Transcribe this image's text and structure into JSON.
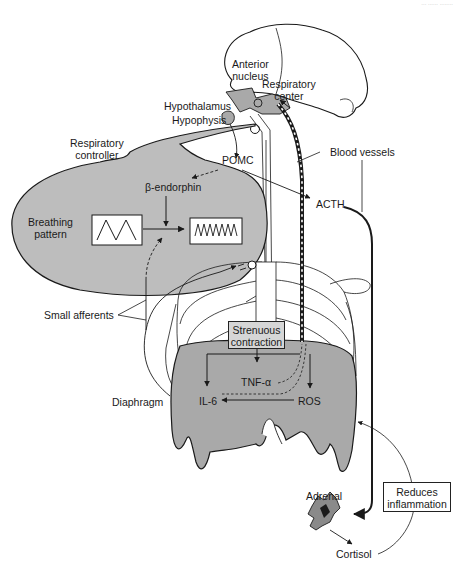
{
  "header": {
    "faint_text": "... ...... ........"
  },
  "colors": {
    "shaded_region": "#bcbcbc",
    "diaphragm": "#a9a9a9",
    "line": "#1a1a1a",
    "background": "#ffffff",
    "box_fill": "#d6d6d6"
  },
  "labels": {
    "anterior_nucleus": "Anterior\nnucleus",
    "respiratory_center": "Respiratory\ncenter",
    "hypothalamus": "Hypothalamus",
    "hypophysis": "Hypophysis",
    "respiratory_controller": "Respiratory\ncontroller",
    "pomc": "POMC",
    "beta_endorphin": "β-endorphin",
    "blood_vessels": "Blood vessels",
    "acth": "ACTH",
    "breathing_pattern": "Breathing\npattern",
    "small_afferents": "Small afferents",
    "strenuous_contraction": "Strenuous\ncontraction",
    "tnf_alpha": "TNF-α",
    "il6": "IL-6",
    "ros": "ROS",
    "diaphragm": "Diaphragm",
    "adrenal": "Adrenal",
    "reduces_inflammation": "Reduces\ninflammation",
    "cortisol": "Cortisol"
  },
  "flows": [
    {
      "from": "Hypophysis",
      "to": "POMC",
      "style": "solid"
    },
    {
      "from": "POMC",
      "to": "β-endorphin",
      "style": "dashed"
    },
    {
      "from": "POMC",
      "to": "ACTH",
      "style": "solid"
    },
    {
      "from": "β-endorphin",
      "to": "Breathing pattern change",
      "style": "solid"
    },
    {
      "from": "Small afferents",
      "to": "Breathing pattern change",
      "style": "dashed"
    },
    {
      "from": "Strenuous contraction",
      "to": "IL-6",
      "style": "solid"
    },
    {
      "from": "Strenuous contraction",
      "to": "TNF-α",
      "style": "solid"
    },
    {
      "from": "Strenuous contraction",
      "to": "ROS",
      "style": "solid"
    },
    {
      "from": "ROS",
      "to": "IL-6",
      "style": "solid"
    },
    {
      "from": "TNF-α",
      "to": "Respiratory center",
      "style": "dashed"
    },
    {
      "from": "IL-6",
      "to": "Respiratory center",
      "style": "dashed"
    },
    {
      "from": "ACTH",
      "to": "Adrenal",
      "style": "bold"
    },
    {
      "from": "Adrenal",
      "to": "Cortisol",
      "style": "solid"
    },
    {
      "from": "Cortisol",
      "to": "Diaphragm",
      "style": "solid",
      "note": "Reduces inflammation"
    }
  ]
}
